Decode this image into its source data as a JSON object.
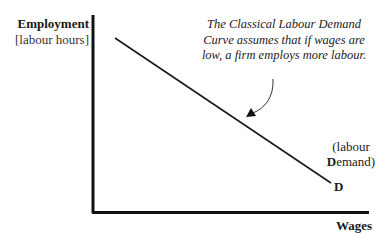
{
  "diagram": {
    "type": "economics-curve",
    "y_axis": {
      "title": "Employment",
      "unit": "[labour hours]"
    },
    "x_axis": {
      "title": "Wages"
    },
    "curve": {
      "name": "D",
      "description_open": "(labour",
      "description_bold": "D",
      "description_rest": "emand)",
      "slope": "downward",
      "color": "#1a1a1a"
    },
    "annotation": {
      "text": "The Classical Labour Demand Curve assumes that if wages are low, a firm employs more labour."
    },
    "colors": {
      "axis": "#111111",
      "line": "#1a1a1a",
      "background": "#ffffff"
    }
  }
}
